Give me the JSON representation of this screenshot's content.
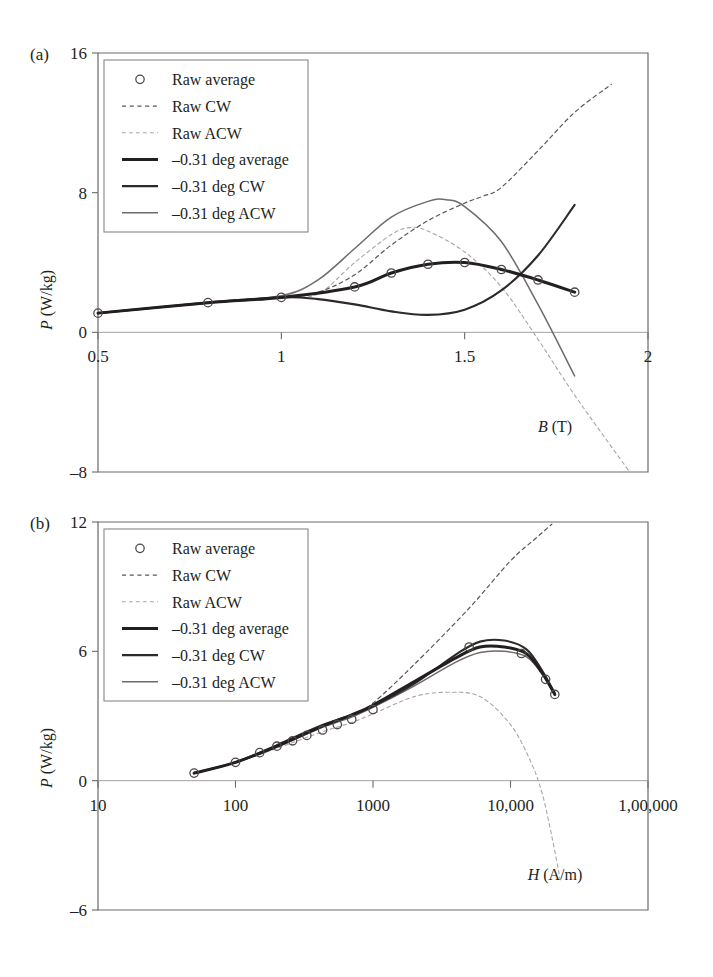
{
  "figure": {
    "panels": [
      {
        "tag": "(a)",
        "xlabel_sym": "B",
        "xlabel_unit": "(T)",
        "ylabel_sym": "P",
        "ylabel_unit": "(W/kg)",
        "xticks": [
          "0.5",
          "1",
          "1.5",
          "2"
        ],
        "yticks": [
          "16",
          "8",
          "0",
          "–8"
        ]
      },
      {
        "tag": "(b)",
        "xlabel_sym": "H",
        "xlabel_unit": "(A/m)",
        "ylabel_sym": "P",
        "ylabel_unit": "(W/kg)",
        "xticks": [
          "10",
          "100",
          "1000",
          "10,000",
          "1,00,000"
        ],
        "yticks": [
          "12",
          "6",
          "0",
          "–6"
        ]
      }
    ],
    "legend": {
      "items": [
        {
          "label": "Raw average",
          "style": "marker",
          "color": "#4c4a48",
          "width": 1.3
        },
        {
          "label": "Raw CW",
          "style": "dashed",
          "color": "#5a5856",
          "width": 1.2
        },
        {
          "label": "Raw ACW",
          "style": "dashed",
          "color": "#a9a6a3",
          "width": 1.1
        },
        {
          "label": "–0.31 deg average",
          "style": "solid",
          "color": "#231f20",
          "width": 3.0
        },
        {
          "label": "–0.31 deg CW",
          "style": "solid",
          "color": "#2d2a28",
          "width": 2.1
        },
        {
          "label": "–0.31 deg ACW",
          "style": "solid",
          "color": "#6e6b69",
          "width": 1.5
        }
      ]
    }
  },
  "chart_data": [
    {
      "type": "line",
      "title": "(a)",
      "xlabel": "B (T)",
      "ylabel": "P (W/kg)",
      "xscale": "linear",
      "xlim": [
        0.5,
        2.0
      ],
      "ylim": [
        -8,
        16
      ],
      "xticks": [
        0.5,
        1.0,
        1.5,
        2.0
      ],
      "yticks": [
        -8,
        0,
        8,
        16
      ],
      "grid": false,
      "legend_position": "top-left",
      "markers": {
        "name": "Raw average",
        "x": [
          0.5,
          0.8,
          1.0,
          1.2,
          1.3,
          1.4,
          1.5,
          1.6,
          1.7,
          1.8
        ],
        "y": [
          1.1,
          1.7,
          2.0,
          2.6,
          3.4,
          3.9,
          4.0,
          3.6,
          3.0,
          2.3
        ]
      },
      "series": [
        {
          "name": "Raw CW",
          "style": "dashed",
          "x": [
            0.5,
            0.8,
            1.0,
            1.1,
            1.2,
            1.3,
            1.4,
            1.5,
            1.55,
            1.6,
            1.7,
            1.8,
            1.9
          ],
          "y": [
            1.1,
            1.7,
            2.0,
            2.3,
            3.3,
            5.0,
            6.4,
            7.4,
            7.8,
            8.3,
            10.4,
            12.6,
            14.2
          ]
        },
        {
          "name": "Raw ACW",
          "style": "dashed",
          "x": [
            0.5,
            0.8,
            1.0,
            1.1,
            1.2,
            1.3,
            1.35,
            1.4,
            1.5,
            1.6,
            1.7,
            1.8,
            1.95
          ],
          "y": [
            1.1,
            1.7,
            2.0,
            2.2,
            4.0,
            5.6,
            6.0,
            5.8,
            4.6,
            2.6,
            -0.4,
            -3.6,
            -8.0
          ]
        },
        {
          "name": "–0.31 deg average",
          "style": "solid",
          "x": [
            0.5,
            0.8,
            1.0,
            1.2,
            1.3,
            1.4,
            1.5,
            1.6,
            1.7,
            1.8
          ],
          "y": [
            1.1,
            1.7,
            2.0,
            2.6,
            3.4,
            3.9,
            4.0,
            3.6,
            3.0,
            2.3
          ]
        },
        {
          "name": "–0.31 deg CW",
          "style": "solid",
          "x": [
            0.5,
            0.8,
            1.0,
            1.1,
            1.2,
            1.3,
            1.4,
            1.5,
            1.6,
            1.7,
            1.8
          ],
          "y": [
            1.1,
            1.7,
            2.0,
            1.9,
            1.6,
            1.2,
            1.0,
            1.3,
            2.4,
            4.4,
            7.3
          ]
        },
        {
          "name": "–0.31 deg ACW",
          "style": "solid",
          "x": [
            0.5,
            0.8,
            1.0,
            1.1,
            1.2,
            1.3,
            1.4,
            1.45,
            1.5,
            1.6,
            1.7,
            1.8
          ],
          "y": [
            1.1,
            1.7,
            2.1,
            3.0,
            4.8,
            6.6,
            7.5,
            7.6,
            7.2,
            5.2,
            1.6,
            -2.5
          ]
        }
      ]
    },
    {
      "type": "line",
      "title": "(b)",
      "xlabel": "H (A/m)",
      "ylabel": "P (W/kg)",
      "xscale": "log",
      "xlim": [
        10,
        100000
      ],
      "ylim": [
        -6,
        12
      ],
      "xticks": [
        10,
        100,
        1000,
        10000,
        100000
      ],
      "yticks": [
        -6,
        0,
        6,
        12
      ],
      "grid": false,
      "legend_position": "top-left",
      "markers": {
        "name": "Raw average",
        "x": [
          50,
          100,
          150,
          200,
          260,
          330,
          430,
          550,
          700,
          1000,
          5000,
          12000,
          18000,
          21000
        ],
        "y": [
          0.35,
          0.85,
          1.3,
          1.6,
          1.85,
          2.1,
          2.35,
          2.6,
          2.85,
          3.3,
          6.2,
          5.9,
          4.7,
          4.0
        ]
      },
      "series": [
        {
          "name": "Raw CW",
          "style": "dashed",
          "x": [
            50,
            100,
            200,
            400,
            700,
            1000,
            2000,
            5000,
            10000,
            15000,
            20000
          ],
          "y": [
            0.35,
            0.85,
            1.6,
            2.4,
            3.0,
            3.6,
            5.4,
            8.0,
            10.2,
            11.2,
            11.9
          ]
        },
        {
          "name": "Raw ACW",
          "style": "dashed",
          "x": [
            50,
            100,
            200,
            400,
            700,
            1000,
            2000,
            3500,
            6000,
            10000,
            14000,
            17000,
            20000,
            23000
          ],
          "y": [
            0.35,
            0.85,
            1.5,
            2.2,
            2.7,
            3.1,
            3.9,
            4.1,
            3.9,
            2.6,
            0.9,
            -0.6,
            -2.6,
            -4.6
          ]
        },
        {
          "name": "–0.31 deg average",
          "style": "solid",
          "x": [
            50,
            100,
            200,
            400,
            700,
            1000,
            2000,
            4000,
            6000,
            9000,
            13000,
            17000,
            21000
          ],
          "y": [
            0.35,
            0.85,
            1.6,
            2.45,
            3.05,
            3.5,
            4.6,
            5.7,
            6.2,
            6.2,
            5.9,
            5.0,
            4.0
          ]
        },
        {
          "name": "–0.31 deg CW",
          "style": "solid",
          "x": [
            50,
            100,
            200,
            400,
            700,
            1000,
            2000,
            4000,
            6000,
            9000,
            13000,
            17000,
            21000
          ],
          "y": [
            0.35,
            0.85,
            1.65,
            2.5,
            3.05,
            3.45,
            4.5,
            5.85,
            6.45,
            6.5,
            6.1,
            5.1,
            4.05
          ]
        },
        {
          "name": "–0.31 deg ACW",
          "style": "solid",
          "x": [
            50,
            100,
            200,
            400,
            700,
            1000,
            2000,
            4000,
            6000,
            9000,
            13000,
            17000,
            21000
          ],
          "y": [
            0.35,
            0.85,
            1.55,
            2.4,
            2.95,
            3.4,
            4.4,
            5.5,
            5.95,
            6.0,
            5.75,
            4.95,
            3.95
          ]
        }
      ]
    }
  ]
}
